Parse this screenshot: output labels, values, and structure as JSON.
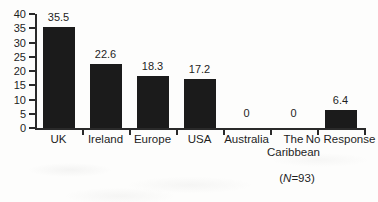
{
  "chart_data": {
    "type": "bar",
    "categories": [
      "UK",
      "Ireland",
      "Europe",
      "USA",
      "Australia",
      "The\nCaribbean",
      "No Response"
    ],
    "values": [
      35.5,
      22.6,
      18.3,
      17.2,
      0,
      0,
      6.4
    ],
    "value_labels": [
      "35.5",
      "22.6",
      "18.3",
      "17.2",
      "0",
      "0",
      "6.4"
    ],
    "title": "",
    "xlabel": "",
    "ylabel": "",
    "ylim": [
      0,
      40
    ],
    "yticks": [
      0,
      5,
      10,
      15,
      20,
      25,
      30,
      35,
      40
    ],
    "grid": false,
    "legend": null,
    "bar_color": "#1b1b1b",
    "axis_color": "#2a2a2a",
    "annotation": {
      "prefix": "(",
      "italic": "N",
      "suffix": "=93)"
    }
  }
}
